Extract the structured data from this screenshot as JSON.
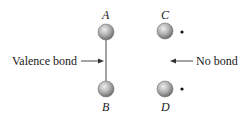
{
  "diagram": {
    "atoms": [
      {
        "id": "A",
        "label": "A",
        "bonded": true
      },
      {
        "id": "B",
        "label": "B",
        "bonded": true
      },
      {
        "id": "C",
        "label": "C",
        "bonded": false,
        "unpaired_electron": true
      },
      {
        "id": "D",
        "label": "D",
        "bonded": false,
        "unpaired_electron": true
      }
    ],
    "annotations": {
      "valence_bond": "Valence bond",
      "no_bond": "No bond"
    },
    "colors": {
      "atom_fill": "#a8a8a8",
      "atom_highlight": "#e6e6e6",
      "line": "#555555",
      "text": "#1a1a1a"
    }
  }
}
